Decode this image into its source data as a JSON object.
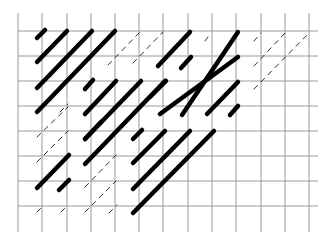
{
  "diagram": {
    "type": "diagonal-line-pattern-on-grid",
    "background": "#ffffff",
    "grid": {
      "color": "#9a9a9a",
      "columns_x": [
        18,
        42,
        67,
        91,
        115,
        139,
        163,
        188,
        212,
        236,
        261,
        285,
        309
      ],
      "rows_y": [
        31,
        56,
        81,
        106,
        131,
        156,
        181,
        206
      ],
      "x_extent": [
        18,
        318
      ],
      "y_extent": [
        13,
        232
      ]
    },
    "thick_color": "#000000",
    "dashed_color": "#333333",
    "thick_segments": [
      [
        37,
        38,
        45,
        30
      ],
      [
        37,
        62,
        67,
        31
      ],
      [
        37,
        88,
        92,
        31
      ],
      [
        37,
        112,
        115,
        31
      ],
      [
        85,
        89,
        93,
        80
      ],
      [
        85,
        114,
        116,
        81
      ],
      [
        85,
        139,
        141,
        81
      ],
      [
        85,
        164,
        165,
        81
      ],
      [
        158,
        66,
        190,
        32
      ],
      [
        181,
        68,
        191,
        57
      ],
      [
        182,
        115,
        238,
        32
      ],
      [
        150,
        97,
        166,
        81
      ],
      [
        160,
        114,
        238,
        57
      ],
      [
        207,
        114,
        238,
        82
      ],
      [
        230,
        115,
        238,
        106
      ],
      [
        133,
        139,
        142,
        130
      ],
      [
        133,
        163,
        165,
        131
      ],
      [
        133,
        189,
        190,
        131
      ],
      [
        133,
        213,
        214,
        131
      ],
      [
        85,
        139,
        101,
        122
      ],
      [
        37,
        188,
        69,
        155
      ],
      [
        59,
        190,
        69,
        180
      ]
    ],
    "dashed_segments": [
      [
        108,
        65,
        140,
        32
      ],
      [
        133,
        63,
        163,
        32
      ],
      [
        205,
        41,
        211,
        33
      ],
      [
        254,
        41,
        261,
        33
      ],
      [
        254,
        66,
        286,
        32
      ],
      [
        254,
        89,
        310,
        32
      ],
      [
        37,
        137,
        68,
        107
      ],
      [
        37,
        162,
        68,
        131
      ],
      [
        37,
        212,
        44,
        205
      ],
      [
        61,
        212,
        68,
        205
      ],
      [
        85,
        187,
        116,
        155
      ],
      [
        85,
        212,
        116,
        181
      ],
      [
        109,
        213,
        117,
        205
      ],
      [
        133,
        164,
        142,
        155
      ],
      [
        158,
        114,
        165,
        107
      ],
      [
        60,
        112,
        68,
        104
      ]
    ]
  }
}
